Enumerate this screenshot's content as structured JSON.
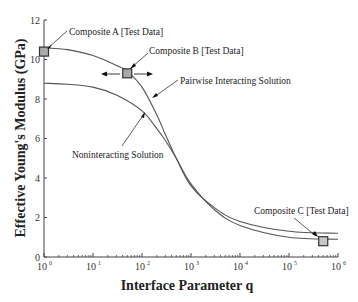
{
  "chart_data": {
    "type": "line",
    "title": "",
    "xlabel": "Interface Parameter q",
    "ylabel": "Effective Young's Modulus (GPa)",
    "xscale": "log",
    "xlim": [
      1,
      1000000
    ],
    "ylim": [
      0,
      12
    ],
    "grid": false,
    "x_ticks": [
      {
        "base": "10",
        "exp": "0"
      },
      {
        "base": "10",
        "exp": "1"
      },
      {
        "base": "10",
        "exp": "2"
      },
      {
        "base": "10",
        "exp": "3"
      },
      {
        "base": "10",
        "exp": "4"
      },
      {
        "base": "10",
        "exp": "5"
      },
      {
        "base": "10",
        "exp": "6"
      }
    ],
    "y_ticks": [
      "0",
      "2",
      "4",
      "6",
      "8",
      "10",
      "12"
    ],
    "series": [
      {
        "name": "Pairwise Interacting Solution",
        "x": [
          1,
          3,
          10,
          30,
          50,
          100,
          200,
          300,
          500,
          1000,
          3000,
          10000,
          100000,
          1000000
        ],
        "y": [
          10.6,
          10.5,
          10.2,
          9.7,
          9.4,
          8.6,
          7.2,
          6.2,
          5.0,
          3.6,
          2.5,
          1.8,
          1.3,
          1.2
        ]
      },
      {
        "name": "Noninteracting Solution",
        "x": [
          1,
          3,
          10,
          30,
          100,
          200,
          300,
          500,
          1000,
          3000,
          10000,
          100000,
          1000000
        ],
        "y": [
          8.8,
          8.75,
          8.6,
          8.2,
          7.4,
          6.5,
          5.9,
          5.0,
          3.7,
          2.4,
          1.6,
          1.0,
          0.9
        ]
      }
    ],
    "test_data": [
      {
        "name": "Composite A [Test Data]",
        "x": 1,
        "y": 10.4
      },
      {
        "name": "Composite B [Test Data]",
        "x": 50,
        "y": 9.3,
        "range_arrows": true
      },
      {
        "name": "Composite C [Test Data]",
        "x": 500000,
        "y": 0.8
      }
    ],
    "annotations": [
      "Composite A [Test Data]",
      "Composite B [Test Data]",
      "Pairwise Interacting Solution",
      "Noninteracting Solution",
      "Composite C [Test Data]"
    ]
  },
  "labels": {
    "composite_a": "Composite A [Test Data]",
    "composite_b": "Composite B [Test Data]",
    "composite_c": "Composite C [Test Data]",
    "pairwise": "Pairwise Interacting Solution",
    "noninteracting": "Noninteracting Solution",
    "xlabel": "Interface Parameter q",
    "ylabel": "Effective Young's Modulus (GPa)"
  },
  "colors": {
    "line": "#555555",
    "marker_fill": "#aaaaaa",
    "marker_stroke": "#333333",
    "axis": "#444444"
  }
}
